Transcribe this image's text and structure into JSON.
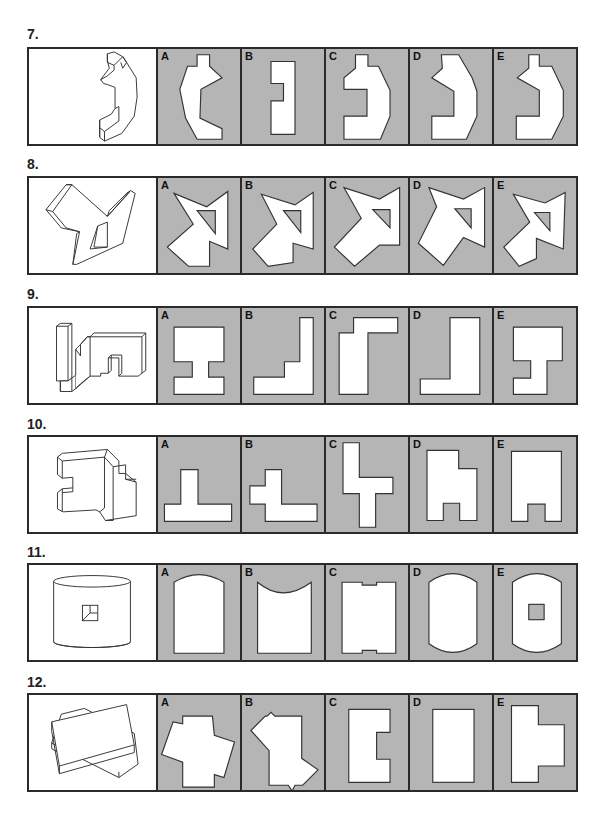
{
  "page": {
    "background": "#ffffff",
    "option_fill": "#b5b5b5",
    "border_color": "#2a2a2a"
  },
  "questions": [
    {
      "number": "7.",
      "stem_icon": "isometric-c-shaped-block-icon",
      "options": [
        {
          "letter": "A",
          "shape": "irregular-c-shape-with-tab"
        },
        {
          "letter": "B",
          "shape": "rectangle-with-notch-left"
        },
        {
          "letter": "C",
          "shape": "c-shape-reversed-notch"
        },
        {
          "letter": "D",
          "shape": "angled-c-shape-reversed"
        },
        {
          "letter": "E",
          "shape": "angled-c-shape-with-tab"
        }
      ]
    },
    {
      "number": "8.",
      "stem_icon": "isometric-star-block-with-triangle-hole-icon",
      "options": [
        {
          "letter": "A",
          "shape": "star-polygon-with-triangle-hole"
        },
        {
          "letter": "B",
          "shape": "star-polygon-with-triangle-hole"
        },
        {
          "letter": "C",
          "shape": "star-polygon-with-triangle-hole"
        },
        {
          "letter": "D",
          "shape": "star-polygon-with-triangle-hole"
        },
        {
          "letter": "E",
          "shape": "star-polygon-with-triangle-hole"
        }
      ]
    },
    {
      "number": "9.",
      "stem_icon": "isometric-step-block-icon",
      "options": [
        {
          "letter": "A",
          "shape": "i-beam-shape"
        },
        {
          "letter": "B",
          "shape": "l-shape-reversed"
        },
        {
          "letter": "C",
          "shape": "reversed-l-tall"
        },
        {
          "letter": "D",
          "shape": "l-shape-reversed-tall"
        },
        {
          "letter": "E",
          "shape": "t-offset-shape"
        }
      ]
    },
    {
      "number": "10.",
      "stem_icon": "isometric-interlocking-block-icon",
      "options": [
        {
          "letter": "A",
          "shape": "inverted-t-shape"
        },
        {
          "letter": "B",
          "shape": "cross-offset-shape"
        },
        {
          "letter": "C",
          "shape": "vertical-cross-shape"
        },
        {
          "letter": "D",
          "shape": "stepped-arch-shape"
        },
        {
          "letter": "E",
          "shape": "arch-shape"
        }
      ]
    },
    {
      "number": "11.",
      "stem_icon": "isometric-cylinder-with-square-icon",
      "options": [
        {
          "letter": "A",
          "shape": "rounded-top-rectangle"
        },
        {
          "letter": "B",
          "shape": "concave-top-rectangle"
        },
        {
          "letter": "C",
          "shape": "notched-rectangle"
        },
        {
          "letter": "D",
          "shape": "barrel-shape"
        },
        {
          "letter": "E",
          "shape": "barrel-shape-with-square-hole"
        }
      ]
    },
    {
      "number": "12.",
      "stem_icon": "isometric-stacked-boxes-icon",
      "options": [
        {
          "letter": "A",
          "shape": "overlapping-rotated-rectangles"
        },
        {
          "letter": "B",
          "shape": "overlapping-rotated-rectangles-alt"
        },
        {
          "letter": "C",
          "shape": "rectangle-with-notch-right"
        },
        {
          "letter": "D",
          "shape": "plain-rectangle"
        },
        {
          "letter": "E",
          "shape": "rectangle-with-tab-right"
        }
      ]
    }
  ]
}
